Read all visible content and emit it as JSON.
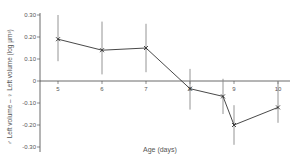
{
  "chart_data": {
    "type": "line",
    "title": "",
    "xlabel": "Age (days)",
    "ylabel": "♂ Left volume – ♀ Left volume (log µm³)",
    "xlim": [
      5,
      10
    ],
    "ylim": [
      -0.3,
      0.3
    ],
    "x_ticks": [
      "5",
      "6",
      "7",
      "8",
      "9",
      "10"
    ],
    "y_ticks": [
      "0.30",
      "0.20",
      "0.10",
      "0",
      "-0.10",
      "-0.20",
      "-0.30"
    ],
    "grid": false,
    "legend": null,
    "series": [
      {
        "name": "difference",
        "marker": "x",
        "points": [
          {
            "x": 5,
            "y": 0.19,
            "err_low": 0.09,
            "err_high": 0.3
          },
          {
            "x": 6,
            "y": 0.14,
            "err_low": 0.03,
            "err_high": 0.27
          },
          {
            "x": 7,
            "y": 0.15,
            "err_low": 0.04,
            "err_high": 0.26
          },
          {
            "x": 8,
            "y": -0.035,
            "err_low": -0.13,
            "err_high": 0.055
          },
          {
            "x": 8.75,
            "y": -0.07,
            "err_low": -0.15,
            "err_high": 0.01
          },
          {
            "x": 9,
            "y": -0.2,
            "err_low": -0.29,
            "err_high": -0.11
          },
          {
            "x": 10,
            "y": -0.12,
            "err_low": -0.19,
            "err_high": -0.005
          }
        ]
      }
    ]
  },
  "colors": {
    "axis": "#444444",
    "line": "#333333",
    "errorbar": "#888888",
    "text": "#555555"
  }
}
